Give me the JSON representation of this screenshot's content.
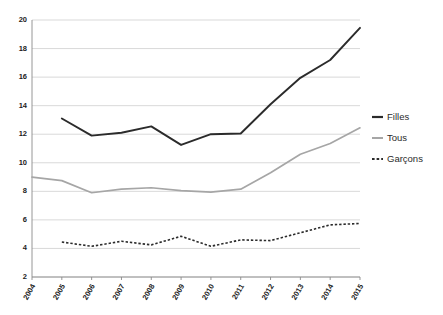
{
  "chart_data": {
    "type": "line",
    "title": "",
    "subtitle": "",
    "xlabel": "",
    "ylabel": "",
    "grid": "horizontal",
    "legend_position": "right",
    "xlim": [
      2004,
      2015
    ],
    "ylim": [
      2,
      20
    ],
    "ytick_step": 2,
    "categories": [
      "2004",
      "2005",
      "2006",
      "2007",
      "2008",
      "2009",
      "2010",
      "2011",
      "2012",
      "2013",
      "2014",
      "2015"
    ],
    "yticks": [
      "2",
      "4",
      "6",
      "8",
      "10",
      "12",
      "14",
      "16",
      "18",
      "20"
    ],
    "series": [
      {
        "name": "Filles",
        "color": "#2b2b2b",
        "style": "solid",
        "x": [
          "2005",
          "2006",
          "2007",
          "2008",
          "2009",
          "2010",
          "2011",
          "2012",
          "2013",
          "2014",
          "2015"
        ],
        "values": [
          13.1,
          11.9,
          12.1,
          12.55,
          11.25,
          12.0,
          12.05,
          14.1,
          15.95,
          17.2,
          19.45
        ]
      },
      {
        "name": "Tous",
        "color": "#a6a6a6",
        "style": "solid",
        "x": [
          "2004",
          "2005",
          "2006",
          "2007",
          "2008",
          "2009",
          "2010",
          "2011",
          "2012",
          "2013",
          "2014",
          "2015"
        ],
        "values": [
          9.0,
          8.75,
          7.9,
          8.15,
          8.25,
          8.05,
          7.95,
          8.15,
          9.3,
          10.6,
          11.35,
          12.45
        ]
      },
      {
        "name": "Garçons",
        "color": "#2b2b2b",
        "style": "dashed",
        "x": [
          "2005",
          "2006",
          "2007",
          "2008",
          "2009",
          "2010",
          "2011",
          "2012",
          "2013",
          "2014",
          "2015"
        ],
        "values": [
          4.45,
          4.15,
          4.5,
          4.25,
          4.85,
          4.15,
          4.6,
          4.55,
          5.1,
          5.65,
          5.75
        ]
      }
    ],
    "legend": [
      {
        "label": "Filles",
        "color": "#2b2b2b",
        "style": "solid"
      },
      {
        "label": "Tous",
        "color": "#a6a6a6",
        "style": "solid"
      },
      {
        "label": "Garçons",
        "color": "#2b2b2b",
        "style": "dashed"
      }
    ]
  }
}
